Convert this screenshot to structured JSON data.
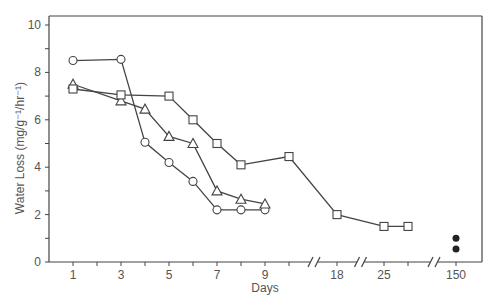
{
  "chart_data": {
    "type": "line",
    "title": "",
    "xlabel": "Days",
    "ylabel": "Water Loss (mg/g⁻¹/hr⁻¹)",
    "ylim": [
      0,
      10
    ],
    "yticks": [
      0,
      2,
      4,
      6,
      8,
      10
    ],
    "xtick_labels": [
      "1",
      "3",
      "5",
      "7",
      "9",
      "18",
      "25",
      "150"
    ],
    "axis_breaks": [
      "between 10 and 18",
      "between 18 and 25",
      "between 28 and 150"
    ],
    "grid": false,
    "legend": null,
    "series": [
      {
        "name": "circles",
        "marker": "open-circle",
        "x": [
          1,
          3,
          4,
          5,
          6,
          7,
          8,
          9
        ],
        "y": [
          8.5,
          8.55,
          5.05,
          4.2,
          3.4,
          2.2,
          2.2,
          2.2
        ]
      },
      {
        "name": "triangles",
        "marker": "open-triangle",
        "x": [
          1,
          3,
          4,
          5,
          6,
          7,
          8,
          9
        ],
        "y": [
          7.5,
          6.8,
          6.45,
          5.3,
          5.0,
          3.0,
          2.65,
          2.45
        ]
      },
      {
        "name": "squares",
        "marker": "open-square",
        "x": [
          1,
          3,
          5,
          6,
          7,
          8,
          10,
          18,
          25,
          28
        ],
        "y": [
          7.3,
          7.05,
          7.0,
          6.0,
          5.0,
          4.1,
          4.45,
          2.0,
          1.5,
          1.5
        ]
      },
      {
        "name": "filled-circles",
        "marker": "filled-circle",
        "x": [
          150,
          150
        ],
        "y": [
          1.0,
          0.55
        ]
      }
    ]
  },
  "axes": {
    "x_title": "Days",
    "y_title": "Water Loss (mg/g⁻¹/hr⁻¹)",
    "y_tick_labels": [
      "0",
      "2",
      "4",
      "6",
      "8",
      "10"
    ],
    "x_tick_labels": [
      "1",
      "3",
      "5",
      "7",
      "9",
      "18",
      "25",
      "150"
    ]
  }
}
